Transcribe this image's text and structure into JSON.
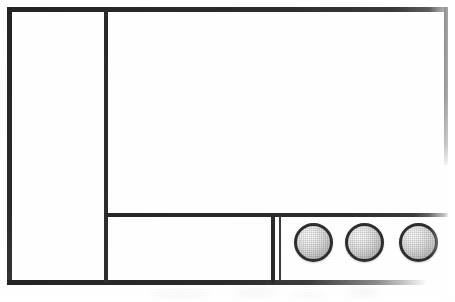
{
  "document": {
    "title": "Scanned panel layout diagram",
    "media": "monochrome scanned line drawing",
    "background_color": "#ffffff",
    "ink_color": "#2b2b2b",
    "width_px": 455,
    "height_px": 302
  },
  "frame": {
    "name": "outer-rectangular-frame",
    "border_color": "#242424",
    "border_thickness_px": 5,
    "right_edge_state": "cropped",
    "bottom_edge_state": "faded-toward-right"
  },
  "rules": [
    {
      "id": "top",
      "orientation": "horizontal",
      "label": "top border"
    },
    {
      "id": "left",
      "orientation": "vertical",
      "label": "left border"
    },
    {
      "id": "right",
      "orientation": "vertical",
      "label": "right border (partial)"
    },
    {
      "id": "bottom",
      "orientation": "horizontal",
      "label": "bottom border (faded)"
    },
    {
      "id": "column",
      "orientation": "vertical",
      "label": "left column divider"
    },
    {
      "id": "row",
      "orientation": "horizontal",
      "label": "lower row divider"
    },
    {
      "id": "cell-a",
      "orientation": "vertical",
      "label": "cell divider outer"
    },
    {
      "id": "cell-b",
      "orientation": "vertical",
      "label": "cell divider inner"
    }
  ],
  "cells": [
    {
      "id": "left-column",
      "label": "left column cell",
      "content": "",
      "state": "empty"
    },
    {
      "id": "upper-panel",
      "label": "upper main panel",
      "content": "",
      "state": "empty"
    },
    {
      "id": "lower-middle",
      "label": "lower middle cell",
      "content": "",
      "state": "empty"
    },
    {
      "id": "circles",
      "label": "lower right cell with spheres",
      "content": "",
      "state": "contains three shaded circles"
    }
  ],
  "circles": {
    "count": 3,
    "shape": "sphere",
    "diameter_px": 39,
    "outline_color": "#2e2e2e",
    "fill_description": "light gray halftone gradient, highlight upper-left",
    "highlight_color": "#fdfdfd",
    "shadow_color": "#9b9b9b",
    "items": [
      {
        "id": "circle-1",
        "label": "",
        "clipped": false
      },
      {
        "id": "circle-2",
        "label": "",
        "clipped": false
      },
      {
        "id": "circle-3",
        "label": "",
        "clipped": true
      }
    ]
  },
  "artifacts": {
    "label": "faint scan smudges below frame",
    "visible": true,
    "count": 4
  }
}
